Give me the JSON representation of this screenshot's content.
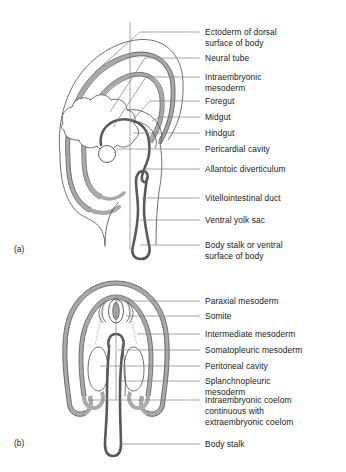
{
  "figure": {
    "background_color": "#ffffff",
    "colors": {
      "ectoderm_band": "#a9a9a9",
      "mesoderm_band": "#a9a9a9",
      "gut_tube": "#595959",
      "thin_outline": "#4d4d4d",
      "leader_line": "#808080",
      "text": "#1a1a1a"
    }
  },
  "panels": [
    {
      "letter": "(a)",
      "name": "sagittal-section",
      "labels": [
        {
          "id": "ectoderm",
          "text": "Ectoderm of dorsal\nsurface of body"
        },
        {
          "id": "neural-tube",
          "text": "Neural tube"
        },
        {
          "id": "intraembryonic-mesoderm",
          "text": "Intraembryonic\nmesoderm"
        },
        {
          "id": "foregut",
          "text": "Foregut"
        },
        {
          "id": "midgut",
          "text": "Midgut"
        },
        {
          "id": "hindgut",
          "text": "Hindgut"
        },
        {
          "id": "pericardial-cavity",
          "text": "Pericardial cavity"
        },
        {
          "id": "allantoic-diverticulum",
          "text": "Allantoic diverticulum"
        },
        {
          "id": "vitellointestinal-duct",
          "text": "Vitellointestinal duct"
        },
        {
          "id": "ventral-yolk-sac",
          "text": "Ventral yolk sac"
        },
        {
          "id": "body-stalk-ventral",
          "text": "Body stalk or ventral\nsurface of body"
        }
      ]
    },
    {
      "letter": "(b)",
      "name": "transverse-section",
      "labels": [
        {
          "id": "paraxial-mesoderm",
          "text": "Paraxial mesoderm"
        },
        {
          "id": "somite",
          "text": "Somite"
        },
        {
          "id": "intermediate-mesoderm",
          "text": "Intermediate mesoderm"
        },
        {
          "id": "somatopleuric-mesoderm",
          "text": "Somatopleuric mesoderm"
        },
        {
          "id": "peritoneal-cavity",
          "text": "Peritoneal cavity"
        },
        {
          "id": "splanchnopleuric-mesoderm",
          "text": "Splanchnopleuric\nmesoderm"
        },
        {
          "id": "intraembryonic-coelom",
          "text": "Intraembryonic coelom\ncontinuous with\nextraembryonic coelom"
        },
        {
          "id": "body-stalk",
          "text": "Body stalk"
        }
      ]
    }
  ]
}
